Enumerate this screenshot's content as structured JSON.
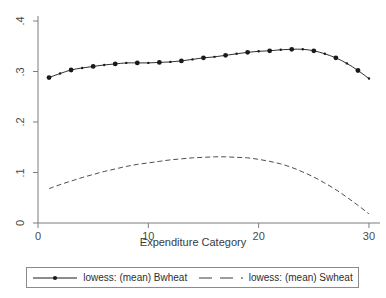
{
  "chart_data": {
    "type": "line",
    "title": "",
    "xlabel": "Expenditure Category",
    "ylabel": "",
    "xlim": [
      0,
      31
    ],
    "ylim": [
      0,
      0.4
    ],
    "grid": false,
    "legend_position": "bottom",
    "xticks": [
      "0",
      "10",
      "20",
      "30"
    ],
    "xtick_values": [
      0,
      10,
      20,
      30
    ],
    "yticks": [
      ".4",
      ".3",
      ".2",
      ".1",
      "0"
    ],
    "ytick_values": [
      0.4,
      0.3,
      0.2,
      0.1,
      0
    ],
    "x": [
      1,
      2,
      3,
      4,
      5,
      6,
      7,
      8,
      9,
      10,
      11,
      12,
      13,
      14,
      15,
      16,
      17,
      18,
      19,
      20,
      21,
      22,
      23,
      24,
      25,
      26,
      27,
      28,
      29,
      30
    ],
    "series": [
      {
        "name": "lowess: (mean) Bwheat",
        "style": "solid",
        "marker": "circle",
        "color": "#1a1a1a",
        "values": [
          0.288,
          0.296,
          0.303,
          0.307,
          0.31,
          0.313,
          0.315,
          0.317,
          0.317,
          0.317,
          0.318,
          0.319,
          0.321,
          0.324,
          0.327,
          0.329,
          0.332,
          0.335,
          0.338,
          0.34,
          0.341,
          0.343,
          0.344,
          0.344,
          0.341,
          0.335,
          0.327,
          0.316,
          0.302,
          0.286
        ]
      },
      {
        "name": "lowess: (mean) Swheat",
        "style": "dashed",
        "marker": "none",
        "color": "#3a3a3a",
        "values": [
          0.068,
          0.076,
          0.083,
          0.09,
          0.096,
          0.102,
          0.107,
          0.112,
          0.116,
          0.119,
          0.122,
          0.125,
          0.127,
          0.129,
          0.13,
          0.131,
          0.131,
          0.13,
          0.129,
          0.126,
          0.122,
          0.117,
          0.11,
          0.101,
          0.091,
          0.079,
          0.066,
          0.051,
          0.035,
          0.018
        ]
      }
    ]
  },
  "axes": {
    "x_title": "Expenditure Category"
  },
  "legend": {
    "entries": [
      {
        "label": "lowess: (mean) Bwheat"
      },
      {
        "label": "lowess: (mean) Swheat"
      }
    ]
  }
}
